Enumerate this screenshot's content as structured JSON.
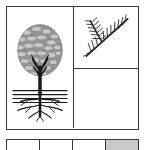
{
  "figure": {
    "caption": "",
    "background_color": "#ffffff",
    "border_color": "#3a3a3a",
    "panels": [
      {
        "id": "panel-tree",
        "name": "whole-tree-panel",
        "label": "",
        "subject": "whole tree with crown, trunk and root system",
        "elements": {
          "canopy": {
            "name": "tree-canopy",
            "description": "rounded mottled crown with pebbled light and dark texture",
            "fill_color": "#949494",
            "speckle_color": "#c4c4c4",
            "outline_color": "#6f6f6f"
          },
          "trunk": {
            "name": "tree-trunk",
            "description": "dark branching trunk rising into the crown",
            "color": "#1c1c1c"
          },
          "ground": {
            "name": "ground-line",
            "description": "horizontal soil surface lines",
            "color": "#1c1c1c",
            "line_count": 4
          },
          "roots": {
            "name": "root-system",
            "description": "spreading lateral and tap roots beneath the ground line",
            "color": "#1c1c1c"
          }
        }
      },
      {
        "id": "panel-branch",
        "name": "conifer-branch-panel",
        "label": "",
        "subject": "conifer branch with needles and a side branchlet",
        "elements": {
          "branch": {
            "name": "conifer-branch",
            "description": "diagonal twig bearing two needled branchlets",
            "color": "#2a2a2a"
          },
          "needles": {
            "name": "conifer-needles",
            "description": "fine needles radiating from the branch axes",
            "color": "#2a2a2a"
          }
        }
      },
      {
        "id": "panel-empty",
        "name": "blank-panel",
        "label": "",
        "subject": "blank white panel",
        "elements": {}
      }
    ]
  },
  "strip": {
    "name": "lower-cell-strip",
    "cells": [
      {
        "label": "",
        "shaded": false,
        "fill": "#ffffff"
      },
      {
        "label": "",
        "shaded": false,
        "fill": "#ffffff"
      },
      {
        "label": "",
        "shaded": false,
        "fill": "#ffffff"
      },
      {
        "label": "",
        "shaded": true,
        "fill": "#c9c9c9"
      }
    ]
  }
}
